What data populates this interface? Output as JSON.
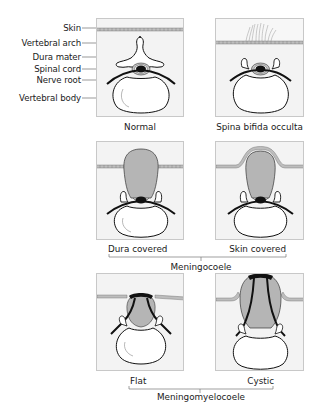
{
  "labels": {
    "skin": "Skin",
    "vertebral_arch": "Vertebral arch",
    "dura_mater": "Dura mater",
    "spinal_cord": "Spinal cord",
    "nerve_root": "Nerve root",
    "vertebral_body": "Vertebral body"
  },
  "panels": [
    {
      "id": "normal",
      "caption": "Normal"
    },
    {
      "id": "spina-bifida-occulta",
      "caption": "Spina bifida occulta"
    },
    {
      "id": "dura-covered",
      "caption": "Dura covered"
    },
    {
      "id": "skin-covered",
      "caption": "Skin covered"
    },
    {
      "id": "flat",
      "caption": "Flat"
    },
    {
      "id": "cystic",
      "caption": "Cystic"
    }
  ],
  "groups": {
    "meningocoele": "Meningocoele",
    "meningomyelocoele": "Meningomyelocoele"
  },
  "colors": {
    "panel_bg": "#f3f3f3",
    "sac_fill": "#b5b5b5",
    "cord": "#111111",
    "skin_band": "#bdbdbd"
  }
}
